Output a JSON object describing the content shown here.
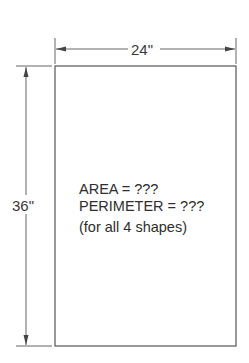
{
  "diagram": {
    "shape": "rectangle",
    "width_dimension": "24\"",
    "height_dimension": "36\"",
    "labels": {
      "area": "AREA = ???",
      "perimeter": "PERIMETER = ???",
      "note": "(for all 4 shapes)"
    },
    "colors": {
      "line": "#555555",
      "text": "#333333",
      "background": "#ffffff"
    }
  }
}
